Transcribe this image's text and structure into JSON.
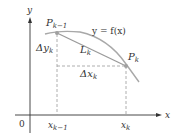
{
  "diagram": {
    "axes": {
      "x_label": "x",
      "y_label": "y",
      "origin_label": "0"
    },
    "curve_label": "y = f(x)",
    "points": [
      {
        "name": "P",
        "sub": "k−1"
      },
      {
        "name": "P",
        "sub": "k"
      }
    ],
    "segment_label": {
      "name": "L",
      "sub": "k"
    },
    "delta_y_label": {
      "name": "Δy",
      "sub": "k"
    },
    "delta_x_label": {
      "name": "Δx",
      "sub": "k"
    },
    "x_ticks": [
      {
        "name": "x",
        "sub": "k−1"
      },
      {
        "name": "x",
        "sub": "k"
      }
    ],
    "colors": {
      "axis": "#333333",
      "curve": "#a8a8a8",
      "chord": "#9a9a9a",
      "dashed": "#9a9a9a",
      "point": "#a0a0a0"
    }
  }
}
